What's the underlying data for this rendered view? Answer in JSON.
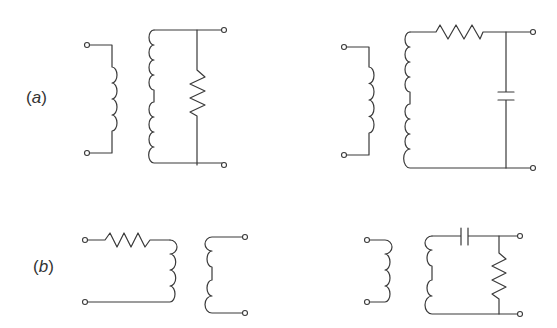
{
  "figure": {
    "labels": {
      "a": "(a)",
      "b": "(b)"
    },
    "a_letter": "a",
    "b_letter": "b",
    "colors": {
      "line": "#3a3a3a",
      "background": "#ffffff"
    },
    "circuits": [
      {
        "id": "a-left",
        "row": "a",
        "description": "Transformer with resistor in parallel across secondary",
        "components": [
          "primary-coil",
          "secondary-coil",
          "resistor-shunt"
        ]
      },
      {
        "id": "a-right",
        "row": "a",
        "description": "Transformer with series resistor and shunt capacitor on secondary",
        "components": [
          "primary-coil",
          "secondary-coil",
          "resistor-series",
          "capacitor-shunt"
        ]
      },
      {
        "id": "b-left",
        "row": "b",
        "description": "Series resistor feeding primary coil, separate secondary coil",
        "components": [
          "resistor-series",
          "primary-coil",
          "secondary-coil"
        ]
      },
      {
        "id": "b-right",
        "row": "b",
        "description": "Transformer with series capacitor and shunt resistor on secondary",
        "components": [
          "primary-coil",
          "secondary-coil",
          "capacitor-series",
          "resistor-shunt"
        ]
      }
    ]
  }
}
